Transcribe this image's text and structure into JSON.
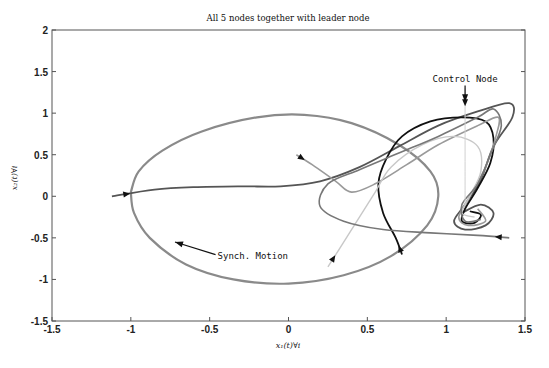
{
  "chart_data": {
    "type": "line",
    "title": "All 5 nodes together with leader node",
    "xlabel": "x₁(t)∀i",
    "ylabel": "x₂(t)∀i",
    "xlim": [
      -1.5,
      1.5
    ],
    "ylim": [
      -1.5,
      2
    ],
    "xticks": [
      -1.5,
      -1,
      -0.5,
      0,
      0.5,
      1,
      1.5
    ],
    "xtick_labels": [
      "-1.5",
      "-1",
      "-0.5",
      "0",
      "0.5",
      "1",
      "1.5"
    ],
    "yticks": [
      -1.5,
      -1,
      -0.5,
      0,
      0.5,
      1,
      1.5,
      2
    ],
    "ytick_labels": [
      "-1.5",
      "-1",
      "-0.5",
      "0",
      "0.5",
      "1",
      "1.5",
      "2"
    ],
    "grid": false,
    "annotations": [
      {
        "text": "Control Node",
        "x": 1.12,
        "y": 1.38,
        "arrow_to": [
          1.12,
          1.13
        ]
      },
      {
        "text": "Synch. Motion",
        "x": -0.45,
        "y": -0.75,
        "arrow_to": [
          -0.72,
          -0.55
        ]
      }
    ],
    "series": [
      {
        "name": "leader-limit-cycle",
        "color": "#8a8a8a",
        "points": [
          [
            -1.0,
            0.05
          ],
          [
            -0.95,
            0.3
          ],
          [
            -0.8,
            0.55
          ],
          [
            -0.55,
            0.78
          ],
          [
            -0.2,
            0.95
          ],
          [
            0.1,
            0.98
          ],
          [
            0.4,
            0.88
          ],
          [
            0.7,
            0.62
          ],
          [
            0.9,
            0.3
          ],
          [
            0.95,
            0.0
          ],
          [
            0.88,
            -0.35
          ],
          [
            0.65,
            -0.72
          ],
          [
            0.35,
            -0.95
          ],
          [
            0.0,
            -1.05
          ],
          [
            -0.35,
            -1.0
          ],
          [
            -0.65,
            -0.82
          ],
          [
            -0.88,
            -0.5
          ],
          [
            -0.98,
            -0.2
          ],
          [
            -1.0,
            0.05
          ]
        ]
      },
      {
        "name": "node-1",
        "color": "#555555",
        "points": [
          [
            -1.12,
            0.0
          ],
          [
            -0.85,
            0.08
          ],
          [
            -0.6,
            0.11
          ],
          [
            -0.3,
            0.12
          ],
          [
            -0.05,
            0.12
          ],
          [
            0.2,
            0.18
          ],
          [
            0.45,
            0.35
          ],
          [
            0.7,
            0.6
          ],
          [
            0.95,
            0.85
          ],
          [
            1.2,
            1.02
          ],
          [
            1.4,
            1.12
          ],
          [
            1.42,
            0.95
          ],
          [
            1.3,
            0.6
          ],
          [
            1.22,
            0.2
          ],
          [
            1.12,
            -0.1
          ],
          [
            1.05,
            -0.3
          ],
          [
            1.12,
            -0.4
          ],
          [
            1.25,
            -0.35
          ],
          [
            1.3,
            -0.2
          ],
          [
            1.22,
            -0.1
          ],
          [
            1.1,
            -0.2
          ]
        ]
      },
      {
        "name": "node-2",
        "color": "#111111",
        "points": [
          [
            0.72,
            -0.7
          ],
          [
            0.68,
            -0.5
          ],
          [
            0.6,
            -0.2
          ],
          [
            0.57,
            0.15
          ],
          [
            0.62,
            0.45
          ],
          [
            0.72,
            0.72
          ],
          [
            0.9,
            0.9
          ],
          [
            1.1,
            0.95
          ],
          [
            1.25,
            0.9
          ],
          [
            1.3,
            0.7
          ],
          [
            1.28,
            0.4
          ],
          [
            1.2,
            0.1
          ],
          [
            1.12,
            -0.15
          ],
          [
            1.1,
            -0.3
          ],
          [
            1.18,
            -0.32
          ],
          [
            1.22,
            -0.22
          ],
          [
            1.15,
            -0.18
          ]
        ]
      },
      {
        "name": "node-3",
        "color": "#9a9a9a",
        "points": [
          [
            0.05,
            0.5
          ],
          [
            0.15,
            0.38
          ],
          [
            0.3,
            0.18
          ],
          [
            0.4,
            0.05
          ],
          [
            0.55,
            0.15
          ],
          [
            0.75,
            0.38
          ],
          [
            0.95,
            0.62
          ],
          [
            1.2,
            0.85
          ],
          [
            1.33,
            0.95
          ],
          [
            1.32,
            0.75
          ],
          [
            1.25,
            0.35
          ],
          [
            1.15,
            0.0
          ],
          [
            1.08,
            -0.25
          ],
          [
            1.14,
            -0.35
          ],
          [
            1.25,
            -0.3
          ],
          [
            1.2,
            -0.15
          ]
        ]
      },
      {
        "name": "node-4",
        "color": "#c8c8c8",
        "points": [
          [
            0.25,
            -0.85
          ],
          [
            0.35,
            -0.55
          ],
          [
            0.45,
            -0.25
          ],
          [
            0.55,
            0.05
          ],
          [
            0.65,
            0.35
          ],
          [
            0.85,
            0.62
          ],
          [
            1.05,
            0.72
          ],
          [
            1.2,
            0.6
          ],
          [
            1.22,
            0.3
          ],
          [
            1.15,
            0.0
          ],
          [
            1.1,
            -0.2
          ],
          [
            1.18,
            -0.25
          ]
        ]
      },
      {
        "name": "node-5",
        "color": "#777777",
        "points": [
          [
            1.4,
            -0.5
          ],
          [
            1.2,
            -0.47
          ],
          [
            0.9,
            -0.44
          ],
          [
            0.6,
            -0.4
          ],
          [
            0.35,
            -0.3
          ],
          [
            0.2,
            -0.12
          ],
          [
            0.25,
            0.15
          ],
          [
            0.45,
            0.32
          ],
          [
            0.7,
            0.52
          ],
          [
            0.95,
            0.72
          ],
          [
            1.2,
            0.95
          ],
          [
            1.3,
            1.05
          ],
          [
            1.35,
            0.85
          ],
          [
            1.28,
            0.5
          ],
          [
            1.2,
            0.15
          ],
          [
            1.1,
            -0.1
          ],
          [
            1.12,
            -0.3
          ],
          [
            1.22,
            -0.28
          ]
        ]
      },
      {
        "name": "control-node",
        "color": "#d0d0d0",
        "points": [
          [
            1.12,
            1.3
          ],
          [
            1.12,
            0.8
          ],
          [
            1.12,
            0.3
          ],
          [
            1.12,
            -0.1
          ]
        ]
      }
    ]
  }
}
